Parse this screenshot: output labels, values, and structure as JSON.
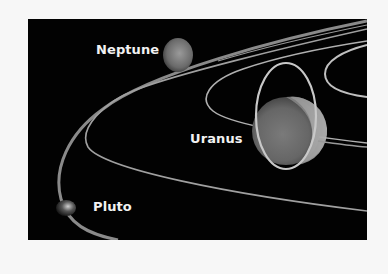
{
  "figure": {
    "background_color": "#020202",
    "page_color": "#f7f7f7",
    "labels": {
      "neptune": "Neptune",
      "uranus": "Uranus",
      "pluto": "Pluto"
    }
  }
}
